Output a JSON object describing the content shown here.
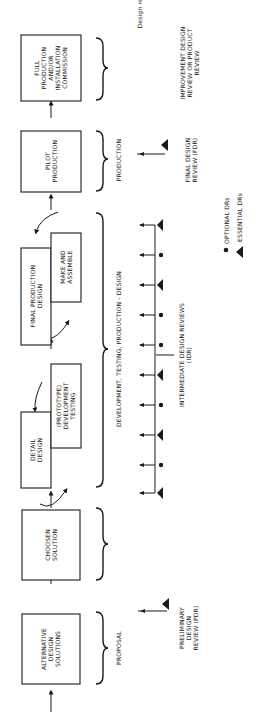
{
  "title_fragment": "Design review",
  "stages": [
    {
      "id": "alternative",
      "lines": [
        "ALTERNATIVE",
        "DESIGN",
        "SOLUTIONS"
      ]
    },
    {
      "id": "chosen",
      "lines": [
        "CHOOSEN",
        "SOLUTION"
      ]
    },
    {
      "id": "detail",
      "lines": [
        "DETAIL",
        "DESIGN"
      ]
    },
    {
      "id": "prototype",
      "lines": [
        "(PROTOTYPE)",
        "DEVELOPMENT",
        "TESTING"
      ]
    },
    {
      "id": "final",
      "lines": [
        "FINAL PRODUCTION",
        "DESIGN"
      ]
    },
    {
      "id": "make",
      "lines": [
        "MAKE AND",
        "ASSEMBLE"
      ]
    },
    {
      "id": "pilot",
      "lines": [
        "PILOT",
        "PRODUCTION"
      ]
    },
    {
      "id": "full",
      "lines": [
        "FULL",
        "PRODUCTION",
        "AND/OR",
        "INSTALLATION",
        "COMMISSION"
      ]
    }
  ],
  "phases": [
    {
      "id": "proposal",
      "label": "PROPOSAL"
    },
    {
      "id": "development",
      "label": "DEVELOPMENT, TESTING, PRODUCTION - DESIGN"
    },
    {
      "id": "production",
      "label": "PRODUCTION"
    }
  ],
  "reviews": {
    "preliminary": [
      "PRELIMINARY",
      "DESIGN",
      "REVIEW (PDR)"
    ],
    "intermediate": [
      "INTERMEDIATE DESIGN REVIEWS",
      "(IDR)"
    ],
    "final": [
      "FINAL DESIGN",
      "REVIEW (FDR)"
    ],
    "improvement": [
      "IMPROVEMENT DESIGN",
      "REVIEW OR PRODUCT",
      "REVIEW"
    ]
  },
  "idr_markers": [
    "essential",
    "optional",
    "essential",
    "optional",
    "optional",
    "essential",
    "optional",
    "essential",
    "optional",
    "essential"
  ],
  "legend": {
    "optional": "OPTIONAL DRs",
    "essential": "ESSENTIAL DRs"
  }
}
